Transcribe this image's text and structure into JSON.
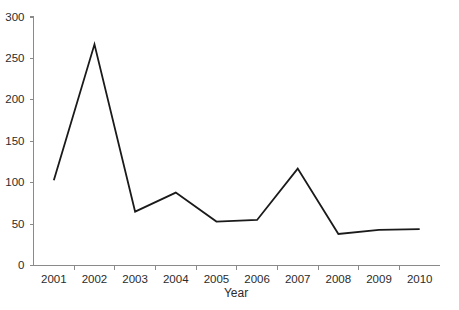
{
  "chart_data": {
    "type": "line",
    "title": "",
    "subtitle": "",
    "xlabel": "Year",
    "ylabel": "",
    "categories": [
      "2001",
      "2002",
      "2003",
      "2004",
      "2005",
      "2006",
      "2007",
      "2008",
      "2009",
      "2010"
    ],
    "values": [
      103,
      267,
      65,
      88,
      53,
      55,
      117,
      38,
      43,
      44
    ],
    "series": [
      {
        "name": "",
        "values": [
          103,
          267,
          65,
          88,
          53,
          55,
          117,
          38,
          43,
          44
        ]
      }
    ],
    "ylim": [
      0,
      300
    ],
    "yticks": [
      0,
      50,
      100,
      150,
      200,
      250,
      300
    ],
    "ytick_labels": [
      "0",
      "50",
      "100",
      "150",
      "200",
      "250",
      "300"
    ],
    "xtick_labels": [
      "2001",
      "2002",
      "2003",
      "2004",
      "2005",
      "2006",
      "2007",
      "2008",
      "2009",
      "2010"
    ],
    "grid": false,
    "legend": false,
    "legend_position": "none",
    "line_color": "#1a1a1a",
    "axis_color": "#8a8a8a",
    "background_color": "#ffffff",
    "markers": false
  },
  "axes": {
    "x_title": "Year",
    "y_title": ""
  }
}
